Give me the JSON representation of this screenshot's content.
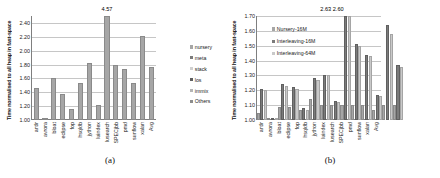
{
  "figure": {
    "panels": [
      {
        "id": "panel-a",
        "subcaption": "(a)",
        "ylabel": "Time normalised to all heap in fast-space",
        "legend_position": "right",
        "legend": [
          {
            "label": "nursery",
            "color": "#a6a6a6"
          },
          {
            "label": "meta",
            "color": "#7b7b7b"
          },
          {
            "label": "stack",
            "color": "#d0d0d0"
          },
          {
            "label": "los",
            "color": "#5f5f5f"
          },
          {
            "label": "immix",
            "color": "#b5b5b5"
          },
          {
            "label": "Others",
            "color": "#8c8c8c"
          }
        ],
        "annotations": [
          {
            "text": "4.57",
            "category": "lusearch"
          }
        ]
      },
      {
        "id": "panel-b",
        "subcaption": "(b)",
        "ylabel": "Time normalised to all heap in fast-space",
        "legend_position": "inner-top-left",
        "legend": [
          {
            "label": "Nursery-16M",
            "color": "#a6a6a6"
          },
          {
            "label": "Interleaving-16M",
            "color": "#7b7b7b"
          },
          {
            "label": "Interleaving-64M",
            "color": "#c9c9c9"
          }
        ],
        "annotations": [
          {
            "text": "2.63 2.60",
            "category": "lusearch"
          }
        ]
      }
    ]
  },
  "chart_data": [
    {
      "type": "bar",
      "title": "",
      "subtitle": "(a)",
      "xlabel": "",
      "ylabel": "Time normalised to all heap in fast-space",
      "ylim": [
        1.0,
        2.5
      ],
      "yticks": [
        "1.00",
        "1.20",
        "1.40",
        "1.60",
        "1.80",
        "2.00",
        "2.20",
        "2.40"
      ],
      "ytick_values": [
        1.0,
        1.2,
        1.4,
        1.6,
        1.8,
        2.0,
        2.2,
        2.4
      ],
      "grid": true,
      "legend_position": "right",
      "legend": [
        "nursery",
        "meta",
        "stack",
        "los",
        "immix",
        "Others"
      ],
      "categories": [
        "antlr",
        "avrora",
        "bloat",
        "eclipse",
        "fop",
        "hsqldb",
        "jython",
        "luindex",
        "lusearch",
        "SPECjbb",
        "pmd",
        "sunflow",
        "xalan",
        "Avg"
      ],
      "values": [
        1.46,
        1.03,
        1.6,
        1.38,
        1.16,
        1.53,
        1.82,
        1.21,
        4.57,
        1.8,
        1.74,
        1.53,
        2.21,
        1.77
      ],
      "clipped": [
        {
          "category": "lusearch",
          "value": 4.57,
          "label": "4.57"
        }
      ],
      "annotations": [
        "4.57"
      ]
    },
    {
      "type": "bar",
      "title": "",
      "subtitle": "(b)",
      "xlabel": "",
      "ylabel": "Time normalised to all heap in fast-space",
      "ylim": [
        1.0,
        1.7
      ],
      "yticks": [
        "1.00",
        "1.10",
        "1.20",
        "1.30",
        "1.40",
        "1.50",
        "1.60",
        "1.70"
      ],
      "ytick_values": [
        1.0,
        1.1,
        1.2,
        1.3,
        1.4,
        1.5,
        1.6,
        1.7
      ],
      "grid": true,
      "legend_position": "inner-top-left",
      "categories": [
        "antlr",
        "avrora",
        "bloat",
        "eclipse",
        "fop",
        "hsqldb",
        "jython",
        "luindex",
        "lusearch",
        "SPECjbb",
        "pmd",
        "sunflow",
        "xalan",
        "Avg"
      ],
      "series": [
        {
          "name": "Nursery-16M",
          "values": [
            1.05,
            1.0,
            1.09,
            1.09,
            1.07,
            1.14,
            1.1,
            1.1,
            1.1,
            1.1,
            1.1,
            1.07,
            1.1,
            1.1
          ]
        },
        {
          "name": "Interleaving-16M",
          "values": [
            1.21,
            1.0,
            1.24,
            1.22,
            1.08,
            1.28,
            1.3,
            1.13,
            2.63,
            1.51,
            1.44,
            1.17,
            1.64,
            1.37
          ]
        },
        {
          "name": "Interleaving-64M",
          "values": [
            1.2,
            1.0,
            1.23,
            1.21,
            1.07,
            1.27,
            1.3,
            1.12,
            2.6,
            1.5,
            1.43,
            1.16,
            1.58,
            1.36
          ]
        }
      ],
      "clipped": [
        {
          "category": "lusearch",
          "series": "Interleaving-16M",
          "value": 2.63,
          "label": "2.63"
        },
        {
          "category": "lusearch",
          "series": "Interleaving-64M",
          "value": 2.6,
          "label": "2.60"
        }
      ],
      "annotations": [
        "2.63 2.60"
      ]
    }
  ]
}
